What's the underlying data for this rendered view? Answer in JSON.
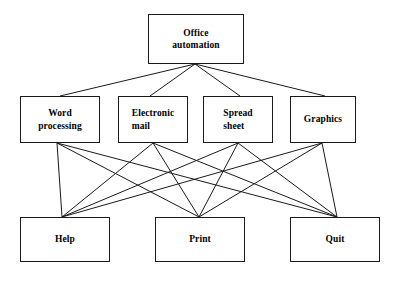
{
  "diagram": {
    "type": "hierarchy-chart",
    "background_color": "#ffffff",
    "line_color": "#1a1a1a",
    "text_color": "#000000",
    "levels": [
      {
        "level": 1,
        "name": "root",
        "nodes": [
          {
            "id": "office-automation",
            "label": "Office\nautomation",
            "x": 148,
            "y": 14,
            "w": 96,
            "h": 50,
            "align": "center"
          }
        ]
      },
      {
        "level": 2,
        "name": "applications",
        "nodes": [
          {
            "id": "word-processing",
            "label": "Word\nprocessing",
            "x": 20,
            "y": 96,
            "w": 80,
            "h": 47,
            "align": "center"
          },
          {
            "id": "electronic-mail",
            "label": "Electronic\nmail",
            "x": 118,
            "y": 96,
            "w": 70,
            "h": 47,
            "align": "left"
          },
          {
            "id": "spread-sheet",
            "label": "Spread\nsheet",
            "x": 203,
            "y": 96,
            "w": 70,
            "h": 47,
            "align": "left"
          },
          {
            "id": "graphics",
            "label": "Graphics",
            "x": 290,
            "y": 96,
            "w": 66,
            "h": 47,
            "align": "center"
          }
        ]
      },
      {
        "level": 3,
        "name": "utilities",
        "nodes": [
          {
            "id": "help",
            "label": "Help",
            "x": 20,
            "y": 217,
            "w": 90,
            "h": 45,
            "align": "center"
          },
          {
            "id": "print",
            "label": "Print",
            "x": 155,
            "y": 217,
            "w": 90,
            "h": 45,
            "align": "center"
          },
          {
            "id": "quit",
            "label": "Quit",
            "x": 290,
            "y": 217,
            "w": 90,
            "h": 45,
            "align": "center"
          }
        ]
      }
    ],
    "edges": {
      "root_fanout": {
        "from": {
          "x": 195,
          "y": 64
        },
        "to": [
          {
            "target": "word-processing",
            "x": 60,
            "y": 96
          },
          {
            "target": "electronic-mail",
            "x": 150,
            "y": 96
          },
          {
            "target": "spread-sheet",
            "x": 240,
            "y": 96
          },
          {
            "target": "graphics",
            "x": 325,
            "y": 96
          }
        ]
      },
      "bipartite": {
        "description": "every level-2 node connects to every level-3 node",
        "sources": [
          {
            "target": "word-processing",
            "x": 57,
            "y": 143
          },
          {
            "target": "electronic-mail",
            "x": 153,
            "y": 143
          },
          {
            "target": "spread-sheet",
            "x": 238,
            "y": 143
          },
          {
            "target": "graphics",
            "x": 322,
            "y": 143
          }
        ],
        "sinks": [
          {
            "target": "help",
            "x": 62,
            "y": 217
          },
          {
            "target": "print",
            "x": 199,
            "y": 217
          },
          {
            "target": "quit",
            "x": 337,
            "y": 217
          }
        ]
      }
    }
  }
}
